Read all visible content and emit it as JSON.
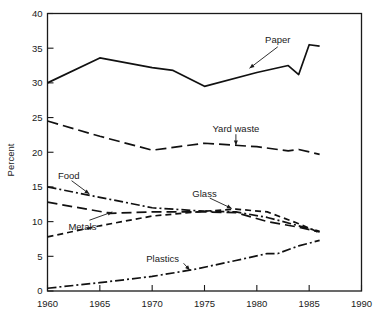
{
  "chart_data": {
    "type": "line",
    "title": "",
    "xlabel": "",
    "ylabel": "Percent",
    "xlim": [
      1960,
      1990
    ],
    "ylim": [
      0,
      40
    ],
    "xticks": [
      1960,
      1965,
      1970,
      1975,
      1980,
      1985,
      1990
    ],
    "yticks": [
      0,
      5,
      10,
      15,
      20,
      25,
      30,
      35,
      40
    ],
    "grid": false,
    "legend_position": "inline-annotations",
    "series": [
      {
        "name": "Paper",
        "line_style": "solid",
        "label_x": 1982,
        "label_y": 36.2,
        "x": [
          1960,
          1965,
          1970,
          1972,
          1975,
          1980,
          1983,
          1984,
          1985,
          1986
        ],
        "y": [
          30.0,
          33.6,
          32.2,
          31.8,
          29.5,
          31.5,
          32.5,
          31.2,
          35.5,
          35.3
        ]
      },
      {
        "name": "Yard waste",
        "line_style": "dashed",
        "label_x": 1978,
        "label_y": 23.4,
        "x": [
          1960,
          1965,
          1970,
          1975,
          1980,
          1983,
          1984,
          1986
        ],
        "y": [
          24.5,
          22.3,
          20.3,
          21.3,
          20.8,
          20.2,
          20.4,
          19.7
        ]
      },
      {
        "name": "Food",
        "line_style": "dashdot",
        "label_x": 1961,
        "label_y": 16.6,
        "x": [
          1960,
          1965,
          1970,
          1975,
          1978,
          1981,
          1984,
          1986
        ],
        "y": [
          15.0,
          13.5,
          12.0,
          11.5,
          11.4,
          10.6,
          9.4,
          8.6
        ]
      },
      {
        "name": "Metals",
        "line_style": "longdash",
        "label_x": 1962,
        "label_y": 9.3,
        "x": [
          1960,
          1966,
          1970,
          1975,
          1978,
          1981,
          1984,
          1986
        ],
        "y": [
          12.8,
          11.2,
          11.4,
          11.4,
          11.3,
          10.0,
          9.2,
          8.5
        ]
      },
      {
        "name": "Glass",
        "line_style": "shortdash",
        "label_x": 1975,
        "label_y": 14.1,
        "x": [
          1960,
          1965,
          1970,
          1975,
          1978,
          1981,
          1984,
          1986
        ],
        "y": [
          7.8,
          9.4,
          10.8,
          11.5,
          11.8,
          11.4,
          9.7,
          8.4
        ]
      },
      {
        "name": "Plastics",
        "line_style": "dashdot",
        "label_x": 1971,
        "label_y": 4.6,
        "x": [
          1960,
          1965,
          1970,
          1974,
          1978,
          1981,
          1982,
          1984,
          1986
        ],
        "y": [
          0.4,
          1.2,
          2.1,
          3.1,
          4.4,
          5.4,
          5.4,
          6.5,
          7.3
        ]
      }
    ]
  },
  "axis": {
    "y_title": "Percent",
    "y_tick_labels": [
      "40",
      "35",
      "30",
      "25",
      "20",
      "15",
      "10",
      "5",
      "0"
    ],
    "x_tick_labels": [
      "1960",
      "1965",
      "1970",
      "1975",
      "1980",
      "1985",
      "1990"
    ]
  },
  "annotations": {
    "paper": "Paper",
    "yard_waste": "Yard waste",
    "food": "Food",
    "metals": "Metals",
    "glass": "Glass",
    "plastics": "Plastics"
  },
  "colors": {
    "ink": "#111111",
    "background": "#ffffff"
  }
}
